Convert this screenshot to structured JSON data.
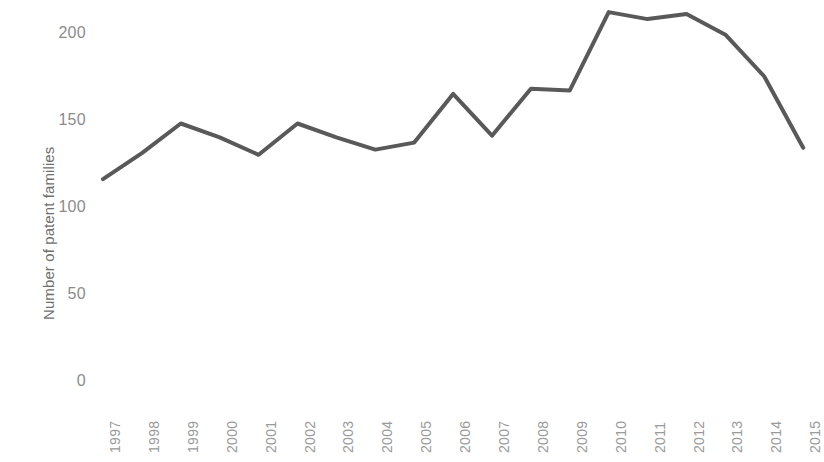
{
  "chart_data": {
    "type": "line",
    "title": "",
    "subtitle": "",
    "xlabel": "",
    "ylabel": "Number of patent families",
    "categories": [
      "1997",
      "1998",
      "1999",
      "2000",
      "2001",
      "2002",
      "2003",
      "2004",
      "2005",
      "2006",
      "2007",
      "2008",
      "2009",
      "2010",
      "2011",
      "2012",
      "2013",
      "2014",
      "2015"
    ],
    "values": [
      116,
      131,
      148,
      140,
      130,
      148,
      140,
      133,
      137,
      165,
      141,
      168,
      167,
      212,
      208,
      211,
      199,
      175,
      134
    ],
    "series": [
      {
        "name": "Number of patent families",
        "values": [
          116,
          131,
          148,
          140,
          130,
          148,
          140,
          133,
          137,
          165,
          141,
          168,
          167,
          212,
          208,
          211,
          199,
          175,
          134
        ],
        "color": "#595959"
      }
    ],
    "ylim": [
      0,
      225
    ],
    "y_ticks": [
      0,
      50,
      100,
      150,
      200
    ],
    "y_tick_labels": [
      "0",
      "50",
      "100",
      "150",
      "200"
    ],
    "grid": false,
    "legend": false,
    "legend_position": "none",
    "axis_lines": false,
    "line_color": "#595959",
    "line_width": 4,
    "x_tick_rotation": -90,
    "tick_label_color": "#8c8c8c",
    "axis_title_color": "#6f6f6f",
    "background": "#ffffff"
  }
}
